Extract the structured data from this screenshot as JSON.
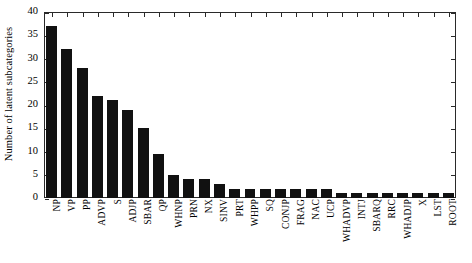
{
  "chart_data": {
    "type": "bar",
    "title": "",
    "xlabel": "",
    "ylabel": "Number of latent subcategories",
    "ylim": [
      0,
      40
    ],
    "yticks": [
      0,
      5,
      10,
      15,
      20,
      25,
      30,
      35,
      40
    ],
    "ytick_labels": [
      "0",
      "5",
      "10",
      "15",
      "20",
      "25",
      "30",
      "35",
      "40"
    ],
    "grid": false,
    "legend": null,
    "bar_color": "#111111",
    "axis_color": "#2a2a2a",
    "categories": [
      "NP",
      "VP",
      "PP",
      "ADVP",
      "S",
      "ADJP",
      "SBAR",
      "QP",
      "WHNP",
      "PRN",
      "NX",
      "SINV",
      "PRT",
      "WHPP",
      "SQ",
      "CONJP",
      "FRAG",
      "NAC",
      "UCP",
      "WHADVP",
      "INTJ",
      "SBARQ",
      "RRC",
      "WHADJP",
      "X",
      "LST",
      "ROOT"
    ],
    "values": [
      37,
      32,
      28,
      22,
      21,
      19,
      15,
      9.5,
      5,
      4,
      4,
      3,
      2,
      2,
      2,
      2,
      2,
      2,
      2,
      1,
      1,
      1,
      1,
      1,
      1,
      1,
      1
    ]
  }
}
